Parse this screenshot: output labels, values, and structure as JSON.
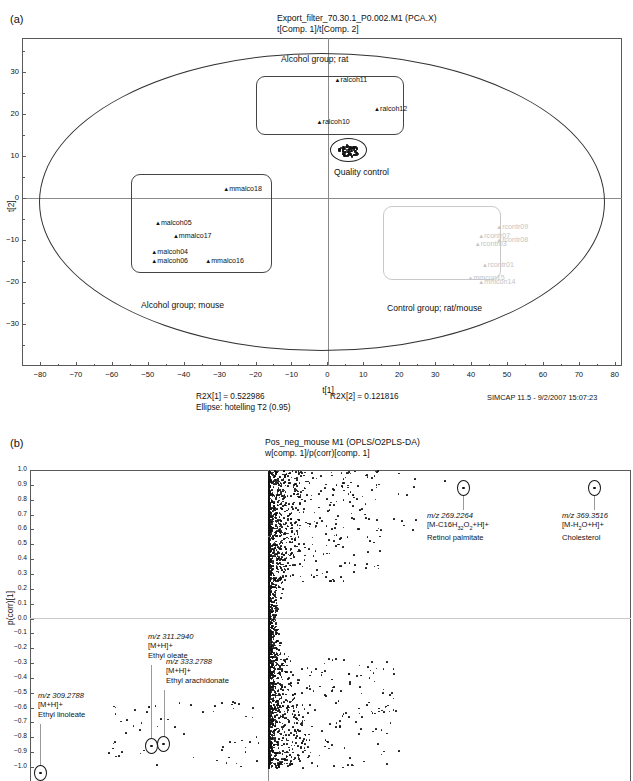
{
  "figure": {
    "panel_a_letter": "(a)",
    "panel_b_letter": "(b)"
  },
  "panel_a": {
    "title_line1": "Export_filter_70.30.1_P0.002.M1 (PCA.X)",
    "title_line2": "t[Comp. 1]/t[Comp. 2]",
    "xlabel": "t[1]",
    "ylabel": "t[2]",
    "stat_r2x1": "R2X[1] = 0.522986",
    "stat_r2x2": "R2X[2] = 0.121816",
    "stat_ellipse": "Ellipse: hotelling T2 (0.95)",
    "software": "SIMCAP 11.5 - 9/2/2007 15:07:23",
    "captions": {
      "alcohol_rat": "Alcohol group; rat",
      "alcohol_mouse": "Alcohol group; mouse",
      "quality_control": "Quality control",
      "control_group": "Control group; rat/mouse"
    }
  },
  "panel_b": {
    "title_line1": "Pos_neg_mouse M1 (OPLS/O2PLS-DA)",
    "title_line2": "w[comp. 1]/p(corr)[comp. 1]",
    "ylabel": "p(corr)[1]"
  },
  "annotations": {
    "retinol": {
      "mz": "m/z 269.2264",
      "adduct_pre": "[M-C16H",
      "adduct_sub1": "32",
      "adduct_mid": "O",
      "adduct_sub2": "2",
      "adduct_post": "+H]+",
      "name": "Retinol palmitate"
    },
    "cholesterol": {
      "mz": "m/z 369.3516",
      "adduct_pre": "[M-H",
      "adduct_sub1": "2",
      "adduct_post": "O+H]+",
      "name": "Cholesterol"
    },
    "ethyl_oleate": {
      "mz": "m/z 311.2940",
      "adduct": "[M+H]+",
      "name": "Ethyl oleate"
    },
    "ethyl_arachidonate": {
      "mz": "m/z 333.2788",
      "adduct": "[M+H]+",
      "name": "Ethyl arachidonate"
    },
    "ethyl_linoleate": {
      "mz": "m/z 309.2788",
      "adduct": "[M+H]+",
      "name": "Ethyl linoleate"
    }
  },
  "chart_data": [
    {
      "type": "scatter",
      "id": "pca-scores",
      "title": "Export_filter_70.30.1_P0.002.M1 (PCA.X) t[Comp. 1]/t[Comp. 2]",
      "xlabel": "t[1]",
      "ylabel": "t[2]",
      "xlim": [
        -85,
        82
      ],
      "ylim": [
        -40,
        38
      ],
      "xticks": [
        -80,
        -70,
        -60,
        -50,
        -40,
        -30,
        -20,
        -10,
        0,
        10,
        20,
        30,
        40,
        50,
        60,
        70,
        80
      ],
      "yticks": [
        -30,
        -20,
        -10,
        0,
        10,
        20,
        30
      ],
      "grid": false,
      "legend": "none",
      "confidence_ellipse": "Hotelling T2 (0.95)",
      "points": [
        {
          "label": "ralcoh11",
          "x": 2,
          "y": 28,
          "group": "Alcohol group; rat"
        },
        {
          "label": "ralcoh12",
          "x": 13,
          "y": 21,
          "group": "Alcohol group; rat"
        },
        {
          "label": "ralcoh10",
          "x": -3,
          "y": 18,
          "group": "Alcohol group; rat"
        },
        {
          "label": "mmalco18",
          "x": -29,
          "y": 2,
          "group": "Alcohol group; mouse"
        },
        {
          "label": "malcoh05",
          "x": -48,
          "y": -6,
          "group": "Alcohol group; mouse"
        },
        {
          "label": "mmalco17",
          "x": -43,
          "y": -9,
          "group": "Alcohol group; mouse"
        },
        {
          "label": "malcoh04",
          "x": -49,
          "y": -13,
          "group": "Alcohol group; mouse"
        },
        {
          "label": "malcoh06",
          "x": -49,
          "y": -15,
          "group": "Alcohol group; mouse"
        },
        {
          "label": "mmalco16",
          "x": -34,
          "y": -15,
          "group": "Alcohol group; mouse"
        },
        {
          "label": "rcontr09",
          "x": 47,
          "y": -7,
          "group": "Control group; rat/mouse"
        },
        {
          "label": "rcontr07",
          "x": 42,
          "y": -9,
          "group": "Control group; rat/mouse"
        },
        {
          "label": "rcontr08",
          "x": 47,
          "y": -10,
          "group": "Control group; rat/mouse"
        },
        {
          "label": "rcontr03",
          "x": 41,
          "y": -11,
          "group": "Control group; rat/mouse"
        },
        {
          "label": "rcontr01",
          "x": 43,
          "y": -16,
          "group": "Control group; rat/mouse"
        },
        {
          "label": "mmcon15",
          "x": 39,
          "y": -19,
          "group": "Control group; rat/mouse"
        },
        {
          "label": "mmcon14",
          "x": 42,
          "y": -20,
          "group": "Control group; rat/mouse"
        },
        {
          "label": "quality control cluster",
          "x": 4,
          "y": 11,
          "group": "Quality control"
        }
      ],
      "annotations": [
        "R2X[1] = 0.522986",
        "R2X[2] = 0.121816",
        "Ellipse: hotelling T2 (0.95)",
        "SIMCAP 11.5 - 9/2/2007 15:07:23"
      ]
    },
    {
      "type": "scatter",
      "id": "opls-sline-loadings",
      "title": "Pos_neg_mouse M1 (OPLS/O2PLS-DA) w[comp. 1]/p(corr)[comp. 1]",
      "xlabel": "w[comp. 1]",
      "ylabel": "p(corr)[1]",
      "ylim": [
        -1.0,
        1.0
      ],
      "yticks": [
        1.0,
        0.9,
        0.8,
        0.7,
        0.6,
        0.5,
        0.4,
        0.3,
        0.2,
        0.1,
        0.0,
        -0.1,
        -0.2,
        -0.3,
        -0.4,
        -0.5,
        -0.6,
        -0.7,
        -0.8,
        -0.9,
        -1.0
      ],
      "grid": false,
      "legend": "none",
      "highlighted_points": [
        {
          "mz": "269.2264",
          "adduct": "[M-C16H32O2+H]+",
          "name": "Retinol palmitate",
          "p_corr": 0.92
        },
        {
          "mz": "369.3516",
          "adduct": "[M-H2O+H]+",
          "name": "Cholesterol",
          "p_corr": 0.92
        },
        {
          "mz": "311.2940",
          "adduct": "[M+H]+",
          "name": "Ethyl oleate",
          "p_corr": -0.93
        },
        {
          "mz": "333.2788",
          "adduct": "[M+H]+",
          "name": "Ethyl arachidonate",
          "p_corr": -0.93
        },
        {
          "mz": "309.2788",
          "adduct": "[M+H]+",
          "name": "Ethyl linoleate",
          "p_corr": -0.98
        }
      ]
    }
  ]
}
